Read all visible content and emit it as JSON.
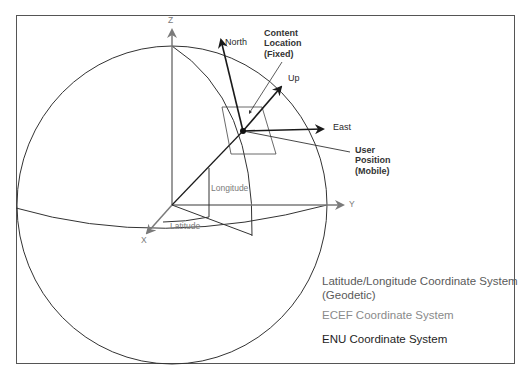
{
  "diagram": {
    "axes": {
      "z_label": "Z",
      "y_label": "Y",
      "x_label": "X"
    },
    "enu_vectors": {
      "north_label": "North",
      "up_label": "Up",
      "east_label": "East"
    },
    "annotations": {
      "content_location": [
        "Content",
        "Location",
        "(Fixed)"
      ],
      "user_position": [
        "User",
        "Position",
        "(Mobile)"
      ],
      "longitude_label": "Longitude",
      "latitude_label": "Latitude"
    },
    "legend": {
      "items": [
        {
          "label": "Latitude/Longitude Coordinate System",
          "label2": "(Geodetic)",
          "color": "#5a5a5a"
        },
        {
          "label": "ECEF Coordinate System",
          "color": "#8a8a8a"
        },
        {
          "label": "ENU Coordinate System",
          "color": "#1e1e1e"
        }
      ]
    },
    "colors": {
      "frame": "#555555",
      "sphere": "#333333",
      "ecef_axis": "#7a7a7a",
      "enu_vector": "#1a1a1a"
    }
  }
}
